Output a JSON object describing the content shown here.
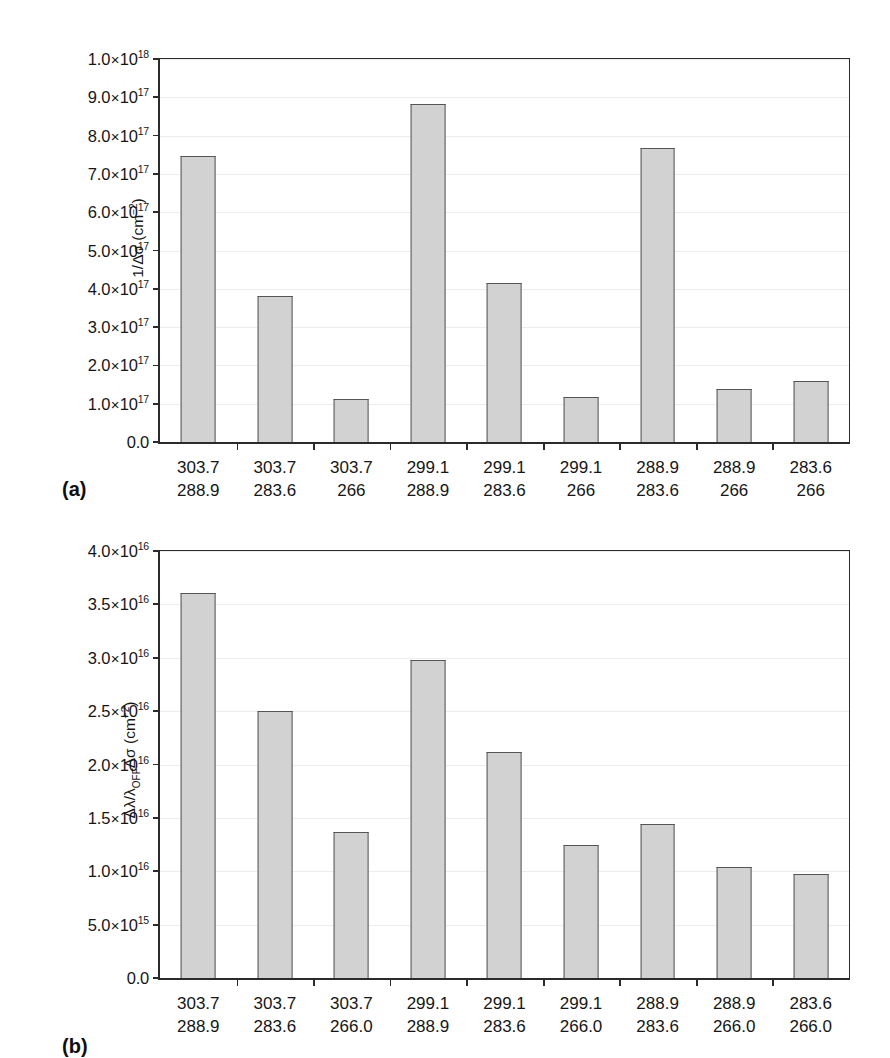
{
  "figure": {
    "panels": [
      {
        "letter": "(a)",
        "id": "a"
      },
      {
        "letter": "(b)",
        "id": "b"
      }
    ]
  },
  "chart_data": [
    {
      "type": "bar",
      "panel": "(a)",
      "title": "",
      "xlabel": "",
      "ylabel": "1/Δσ (cm⁻²)",
      "ylabel_parts": {
        "prefix": "1/Δσ (cm",
        "exponent": "−2",
        "suffix": ")"
      },
      "categories": [
        "303.7 / 288.9",
        "303.7 / 283.6",
        "303.7 / 266",
        "299.1 / 288.9",
        "299.1 / 283.6",
        "299.1 / 266",
        "288.9 / 283.6",
        "288.9 / 266",
        "283.6 / 266"
      ],
      "tick_labels_line1": [
        "303.7",
        "303.7",
        "303.7",
        "299.1",
        "299.1",
        "299.1",
        "288.9",
        "288.9",
        "283.6"
      ],
      "tick_labels_line2": [
        "288.9",
        "283.6",
        "266",
        "288.9",
        "283.6",
        "266",
        "283.6",
        "266",
        "266"
      ],
      "values": [
        7.48e+17,
        3.8e+17,
        1.12e+17,
        8.82e+17,
        4.15e+17,
        1.18e+17,
        7.68e+17,
        1.38e+17,
        1.6e+17
      ],
      "ylim": [
        0,
        1e+18
      ],
      "ytick_values": [
        0,
        1e+17,
        2e+17,
        3e+17,
        4e+17,
        5e+17,
        6e+17,
        7e+17,
        8e+17,
        9e+17,
        1e+18
      ],
      "ytick_labels": [
        {
          "mantissa": "0.0",
          "exponent": null
        },
        {
          "mantissa": "1.0",
          "exponent": "17"
        },
        {
          "mantissa": "2.0",
          "exponent": "17"
        },
        {
          "mantissa": "3.0",
          "exponent": "17"
        },
        {
          "mantissa": "4.0",
          "exponent": "17"
        },
        {
          "mantissa": "5.0",
          "exponent": "17"
        },
        {
          "mantissa": "6.0",
          "exponent": "17"
        },
        {
          "mantissa": "7.0",
          "exponent": "17"
        },
        {
          "mantissa": "8.0",
          "exponent": "17"
        },
        {
          "mantissa": "9.0",
          "exponent": "17"
        },
        {
          "mantissa": "1.0",
          "exponent": "18"
        }
      ],
      "grid": true,
      "legend": null,
      "bar_color": "#d2d2d2",
      "bar_border_color": "#555555",
      "axis_color": "#2b2b2b",
      "grid_color": "#ededed"
    },
    {
      "type": "bar",
      "panel": "(b)",
      "title": "",
      "xlabel": "",
      "ylabel": "Δλ/λOFFΔσ (cm⁻²)",
      "ylabel_parts": {
        "prefix": "Δλ/λ",
        "subscript": "OFF",
        "middle": "Δσ (cm",
        "exponent": "−2",
        "suffix": ")"
      },
      "categories": [
        "303.7 / 288.9",
        "303.7 / 283.6",
        "303.7 / 266.0",
        "299.1 / 288.9",
        "299.1 / 283.6",
        "299.1 / 266.0",
        "288.9 / 283.6",
        "288.9 / 266.0",
        "283.6 / 266.0"
      ],
      "tick_labels_line1": [
        "303.7",
        "303.7",
        "303.7",
        "299.1",
        "299.1",
        "299.1",
        "288.9",
        "288.9",
        "283.6"
      ],
      "tick_labels_line2": [
        "288.9",
        "283.6",
        "266.0",
        "288.9",
        "283.6",
        "266.0",
        "283.6",
        "266.0",
        "266.0"
      ],
      "values": [
        3.61e+16,
        2.5e+16,
        1.365e+16,
        2.98e+16,
        2.12e+16,
        1.25e+16,
        1.44e+16,
        1.04e+16,
        9750000000000000.0
      ],
      "ylim": [
        0,
        4e+16
      ],
      "ytick_values": [
        0,
        5000000000000000.0,
        1e+16,
        1.5e+16,
        2e+16,
        2.5e+16,
        3e+16,
        3.5e+16,
        4e+16
      ],
      "ytick_labels": [
        {
          "mantissa": "0.0",
          "exponent": null
        },
        {
          "mantissa": "5.0",
          "exponent": "15"
        },
        {
          "mantissa": "1.0",
          "exponent": "16"
        },
        {
          "mantissa": "1.5",
          "exponent": "16"
        },
        {
          "mantissa": "2.0",
          "exponent": "16"
        },
        {
          "mantissa": "2.5",
          "exponent": "16"
        },
        {
          "mantissa": "3.0",
          "exponent": "16"
        },
        {
          "mantissa": "3.5",
          "exponent": "16"
        },
        {
          "mantissa": "4.0",
          "exponent": "16"
        }
      ],
      "grid": true,
      "legend": null,
      "bar_color": "#d2d2d2",
      "bar_border_color": "#555555",
      "axis_color": "#2b2b2b",
      "grid_color": "#ededed"
    }
  ]
}
